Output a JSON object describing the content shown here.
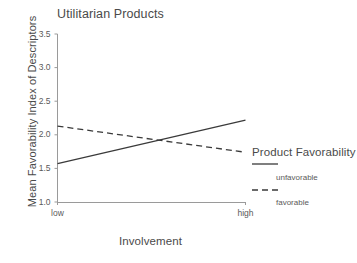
{
  "chart_data": {
    "type": "line",
    "title": "Utilitarian Products",
    "xlabel": "Involvement",
    "ylabel": "Mean Favorability Index of Descriptors",
    "x": [
      "low",
      "high"
    ],
    "xtick_labels": [
      "low",
      "high"
    ],
    "ytick_labels": [
      "1.0",
      "1.5",
      "2.0",
      "2.5",
      "3.0",
      "3.5"
    ],
    "ytick_values": [
      1.0,
      1.5,
      2.0,
      2.5,
      3.0,
      3.5
    ],
    "ylim": [
      1.0,
      3.5
    ],
    "grid": false,
    "legend_position": "right",
    "legend_title": "Product Favorability",
    "series": [
      {
        "name": "unfavorable",
        "style": "solid",
        "color": "#3a3a3a",
        "values": [
          1.57,
          2.22
        ]
      },
      {
        "name": "favorable",
        "style": "dashed",
        "color": "#3a3a3a",
        "values": [
          2.13,
          1.74
        ]
      }
    ],
    "annotations": [
      {
        "text": "lines cross",
        "x": "mid",
        "y": 1.92
      }
    ]
  }
}
